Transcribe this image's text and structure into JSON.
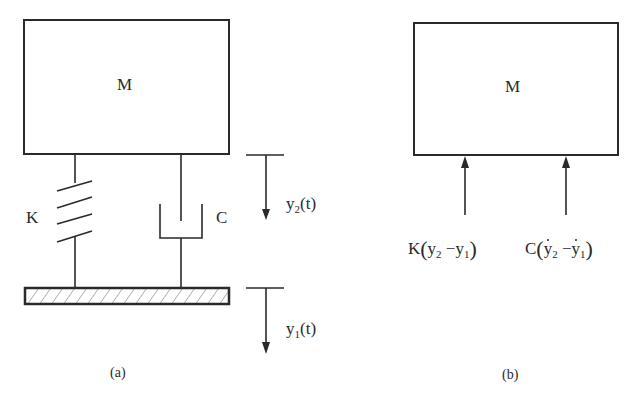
{
  "diagram_a": {
    "mass_label": "M",
    "spring_label": "K",
    "damper_label": "C",
    "y2": {
      "base": "y",
      "sub": "2",
      "arg": "(t)"
    },
    "y1": {
      "base": "y",
      "sub": "1",
      "arg": "(t)"
    },
    "caption": "(a)"
  },
  "diagram_b": {
    "mass_label": "M",
    "spring_force": {
      "coef": "K",
      "open": "(",
      "a": "y",
      "a_sub": "2",
      "minus": "−",
      "b": "y",
      "b_sub": "1",
      "close": ")"
    },
    "damper_force": {
      "coef": "C",
      "open": "(",
      "a": "y",
      "a_sub": "2",
      "minus": "−",
      "b": "y",
      "b_sub": "1",
      "close": ")"
    },
    "caption": "(b)"
  },
  "colors": {
    "stroke": "#2a2a2a",
    "background": "#ffffff"
  }
}
